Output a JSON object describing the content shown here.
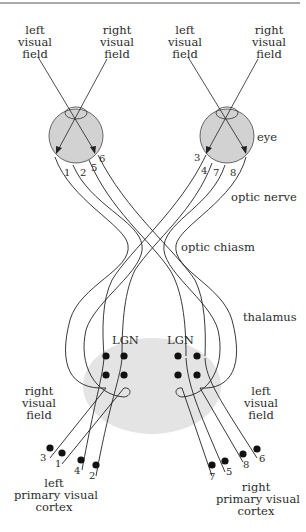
{
  "diagram": {
    "type": "visual pathway diagram",
    "colors": {
      "line": "#222222",
      "eye_fill": "#d2d2d2",
      "thalamus_fill": "#e4e4e4",
      "rule": "#555555"
    },
    "labels": {
      "left_eye_left_field": [
        "left",
        "visual",
        "field"
      ],
      "left_eye_right_field": [
        "right",
        "visual",
        "field"
      ],
      "right_eye_left_field": [
        "left",
        "visual",
        "field"
      ],
      "right_eye_right_field": [
        "right",
        "visual",
        "field"
      ],
      "eye": "eye",
      "optic_nerve": "optic nerve",
      "optic_chiasm": "optic chiasm",
      "thalamus": "thalamus",
      "lgn_left": "LGN",
      "lgn_right": "LGN",
      "lower_right_visual_field": [
        "right",
        "visual",
        "field"
      ],
      "lower_left_visual_field": [
        "left",
        "visual",
        "field"
      ],
      "left_cortex": [
        "left",
        "primary visual",
        "cortex"
      ],
      "right_cortex": [
        "right",
        "primary visual",
        "cortex"
      ]
    },
    "fiber_numbers": {
      "left_eye": [
        "1",
        "2",
        "5",
        "6"
      ],
      "right_eye": [
        "3",
        "4",
        "7",
        "8"
      ],
      "left_cortex": [
        "3",
        "1",
        "4",
        "2"
      ],
      "right_cortex": [
        "7",
        "5",
        "8",
        "6"
      ]
    }
  }
}
